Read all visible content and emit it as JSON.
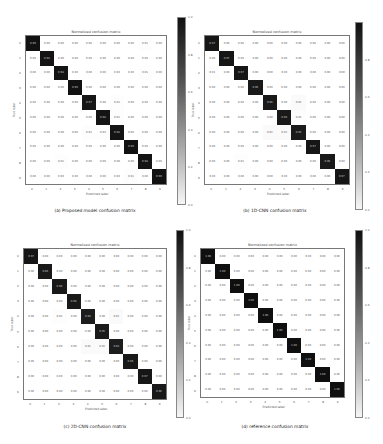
{
  "chart_data": [
    {
      "type": "heatmap",
      "title": "Normalized confusion matrix",
      "caption": "(a) Proposed model confusion matrix",
      "xlabel": "Predicted label",
      "ylabel": "True label",
      "x_ticks": [
        "0",
        "1",
        "2",
        "3",
        "4",
        "5",
        "6",
        "7",
        "8",
        "9"
      ],
      "y_ticks": [
        "0",
        "1",
        "2",
        "3",
        "4",
        "5",
        "6",
        "7",
        "8",
        "9"
      ],
      "colorbar": {
        "min": 0.0,
        "max": 1.0,
        "ticks": [
          "1.0",
          "0.8",
          "0.6",
          "0.4",
          "0.2",
          "0.0"
        ],
        "colormap": "Greys"
      },
      "values": [
        [
          0.99,
          0.0,
          0.0,
          0.0,
          0.0,
          0.0,
          0.0,
          0.0,
          0.01,
          0.0
        ],
        [
          0.0,
          0.98,
          0.0,
          0.0,
          0.0,
          0.0,
          0.0,
          0.0,
          0.0,
          0.0
        ],
        [
          0.0,
          0.0,
          0.98,
          0.0,
          0.0,
          0.0,
          0.0,
          0.0,
          0.01,
          0.0
        ],
        [
          0.0,
          0.0,
          0.0,
          0.99,
          0.0,
          0.0,
          0.0,
          0.0,
          0.0,
          0.0
        ],
        [
          0.0,
          0.0,
          0.0,
          0.0,
          0.97,
          0.0,
          0.01,
          0.0,
          0.0,
          0.0
        ],
        [
          0.0,
          0.0,
          0.0,
          0.0,
          0.0,
          0.98,
          0.01,
          0.0,
          0.0,
          0.0
        ],
        [
          0.0,
          0.0,
          0.0,
          0.0,
          0.01,
          0.01,
          0.98,
          0.0,
          0.0,
          0.0
        ],
        [
          0.0,
          0.0,
          0.0,
          0.0,
          0.0,
          0.0,
          0.0,
          0.99,
          0.0,
          0.0
        ],
        [
          0.0,
          0.0,
          0.01,
          0.0,
          0.0,
          0.0,
          0.0,
          0.0,
          0.98,
          0.0
        ],
        [
          0.0,
          0.0,
          0.0,
          0.0,
          0.0,
          0.0,
          0.0,
          0.01,
          0.0,
          0.99
        ]
      ]
    },
    {
      "type": "heatmap",
      "title": "Normalized confusion matrix",
      "caption": "(b) 1D-CNN confusion matrix",
      "xlabel": "Predicted label",
      "ylabel": "True label",
      "x_ticks": [
        "0",
        "1",
        "2",
        "3",
        "4",
        "5",
        "6",
        "7",
        "8",
        "9"
      ],
      "y_ticks": [
        "0",
        "1",
        "2",
        "3",
        "4",
        "5",
        "6",
        "7",
        "8",
        "9"
      ],
      "colorbar": {
        "min": 0.0,
        "max": 1.0,
        "ticks": [
          "0.8",
          "0.6",
          "0.4",
          "0.2",
          "0.0"
        ],
        "colormap": "Greys"
      },
      "values": [
        [
          0.97,
          0.0,
          0.0,
          0.0,
          0.0,
          0.0,
          0.0,
          0.0,
          0.0,
          0.0
        ],
        [
          0.0,
          0.97,
          0.0,
          0.0,
          0.0,
          0.0,
          0.0,
          0.0,
          0.0,
          0.0
        ],
        [
          0.01,
          0.0,
          0.97,
          0.0,
          0.0,
          0.0,
          0.0,
          0.0,
          0.0,
          0.0
        ],
        [
          0.0,
          0.0,
          0.0,
          0.96,
          0.0,
          0.0,
          0.0,
          0.0,
          0.0,
          0.0
        ],
        [
          0.0,
          0.0,
          0.0,
          0.0,
          0.96,
          0.0,
          0.02,
          0.0,
          0.0,
          0.0
        ],
        [
          0.0,
          0.0,
          0.0,
          0.0,
          0.0,
          0.96,
          0.01,
          0.0,
          0.0,
          0.0
        ],
        [
          0.0,
          0.0,
          0.0,
          0.0,
          0.02,
          0.02,
          0.95,
          0.0,
          0.0,
          0.0
        ],
        [
          0.0,
          0.0,
          0.0,
          0.0,
          0.0,
          0.0,
          0.0,
          0.97,
          0.0,
          0.0
        ],
        [
          0.0,
          0.0,
          0.01,
          0.0,
          0.0,
          0.0,
          0.0,
          0.0,
          0.96,
          0.0
        ],
        [
          0.0,
          0.0,
          0.0,
          0.0,
          0.0,
          0.0,
          0.0,
          0.0,
          0.0,
          0.97
        ]
      ]
    },
    {
      "type": "heatmap",
      "title": "Normalized confusion matrix",
      "caption": "(c) 2D-CNN confusion matrix",
      "xlabel": "Predicted label",
      "ylabel": "True label",
      "x_ticks": [
        "0",
        "1",
        "2",
        "3",
        "4",
        "5",
        "6",
        "7",
        "8",
        "9"
      ],
      "y_ticks": [
        "0",
        "1",
        "2",
        "3",
        "4",
        "5",
        "6",
        "7",
        "8",
        "9"
      ],
      "colorbar": {
        "min": 0.0,
        "max": 1.0,
        "ticks": [
          "1.0",
          "0.8",
          "0.6",
          "0.4",
          "0.2",
          "0.0"
        ],
        "colormap": "Greys"
      },
      "values": [
        [
          0.97,
          0.0,
          0.0,
          0.0,
          0.0,
          0.0,
          0.0,
          0.0,
          0.0,
          0.0
        ],
        [
          0.0,
          0.96,
          0.0,
          0.0,
          0.0,
          0.0,
          0.0,
          0.0,
          0.0,
          0.0
        ],
        [
          0.0,
          0.0,
          0.96,
          0.0,
          0.0,
          0.0,
          0.0,
          0.0,
          0.0,
          0.0
        ],
        [
          0.0,
          0.0,
          0.0,
          0.96,
          0.0,
          0.0,
          0.0,
          0.0,
          0.0,
          0.0
        ],
        [
          0.0,
          0.0,
          0.01,
          0.0,
          0.94,
          0.0,
          0.02,
          0.0,
          0.0,
          0.0
        ],
        [
          0.0,
          0.0,
          0.0,
          0.0,
          0.0,
          0.95,
          0.0,
          0.0,
          0.0,
          0.0
        ],
        [
          0.0,
          0.0,
          0.0,
          0.0,
          0.02,
          0.02,
          0.94,
          0.0,
          0.0,
          0.0
        ],
        [
          0.0,
          0.0,
          0.0,
          0.0,
          0.0,
          0.0,
          0.0,
          0.96,
          0.0,
          0.0
        ],
        [
          0.0,
          0.0,
          0.0,
          0.0,
          0.0,
          0.0,
          0.0,
          0.0,
          0.97,
          0.0
        ],
        [
          0.0,
          0.0,
          0.0,
          0.0,
          0.0,
          0.0,
          0.0,
          0.0,
          0.0,
          0.96
        ]
      ]
    },
    {
      "type": "heatmap",
      "title": "Normalized confusion matrix",
      "caption": "(d) reference confusion matrix",
      "xlabel": "Predicted label",
      "ylabel": "True label",
      "x_ticks": [
        "0",
        "1",
        "2",
        "3",
        "4",
        "5",
        "6",
        "7",
        "8",
        "9"
      ],
      "y_ticks": [
        "0",
        "1",
        "2",
        "3",
        "4",
        "5",
        "6",
        "7",
        "8",
        "9"
      ],
      "colorbar": {
        "min": 0.0,
        "max": 1.0,
        "ticks": [
          "1.0",
          "0.8",
          "0.6",
          "0.4",
          "0.2",
          "0.0"
        ],
        "colormap": "Greys"
      },
      "values": [
        [
          1.0,
          0.0,
          0.0,
          0.0,
          0.0,
          0.0,
          0.0,
          0.0,
          0.0,
          0.0
        ],
        [
          0.0,
          1.0,
          0.0,
          0.0,
          0.0,
          0.0,
          0.0,
          0.0,
          0.0,
          0.0
        ],
        [
          0.0,
          0.0,
          1.0,
          0.0,
          0.0,
          0.0,
          0.0,
          0.0,
          0.0,
          0.0
        ],
        [
          0.0,
          0.0,
          0.0,
          1.0,
          0.0,
          0.0,
          0.0,
          0.0,
          0.0,
          0.0
        ],
        [
          0.0,
          0.0,
          0.0,
          0.0,
          1.0,
          0.0,
          0.0,
          0.0,
          0.0,
          0.0
        ],
        [
          0.0,
          0.0,
          0.0,
          0.0,
          0.0,
          1.0,
          0.0,
          0.0,
          0.0,
          0.0
        ],
        [
          0.0,
          0.0,
          0.0,
          0.0,
          0.0,
          0.0,
          1.0,
          0.0,
          0.0,
          0.0
        ],
        [
          0.0,
          0.0,
          0.0,
          0.0,
          0.0,
          0.0,
          0.0,
          1.0,
          0.0,
          0.0
        ],
        [
          0.0,
          0.0,
          0.0,
          0.0,
          0.0,
          0.0,
          0.0,
          0.0,
          1.0,
          0.0
        ],
        [
          0.0,
          0.0,
          0.0,
          0.0,
          0.0,
          0.0,
          0.0,
          0.0,
          0.0,
          1.0
        ]
      ]
    }
  ],
  "layout": [
    {
      "axes": {
        "left": 25,
        "top": 35,
        "width": 142,
        "height": 150
      },
      "cbar": {
        "left": 177,
        "top": 17,
        "width": 9,
        "height": 188
      },
      "caption": {
        "left": 20,
        "top": 208,
        "width": 150
      }
    },
    {
      "axes": {
        "left": 204,
        "top": 35,
        "width": 146,
        "height": 150
      },
      "cbar": {
        "left": 355,
        "top": 22,
        "width": 8,
        "height": 188
      },
      "caption": {
        "left": 200,
        "top": 208,
        "width": 150
      }
    },
    {
      "axes": {
        "left": 23,
        "top": 248,
        "width": 144,
        "height": 152
      },
      "cbar": {
        "left": 176,
        "top": 230,
        "width": 8,
        "height": 188
      },
      "caption": {
        "left": 20,
        "top": 424,
        "width": 150
      }
    },
    {
      "axes": {
        "left": 200,
        "top": 248,
        "width": 145,
        "height": 150
      },
      "cbar": {
        "left": 355,
        "top": 230,
        "width": 8,
        "height": 188
      },
      "caption": {
        "left": 200,
        "top": 424,
        "width": 150
      }
    }
  ]
}
